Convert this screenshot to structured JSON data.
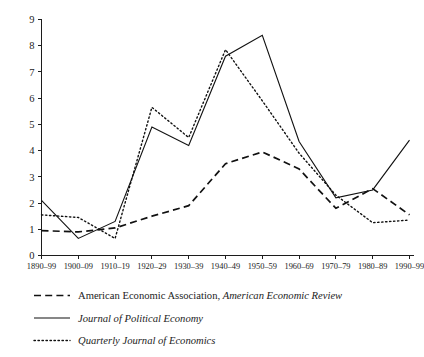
{
  "chart_data": {
    "type": "line",
    "title": "",
    "subtitle": "",
    "xlabel": "",
    "ylabel": "",
    "categories": [
      "1890–99",
      "1900–09",
      "1910–19",
      "1920–29",
      "1930–39",
      "1940–49",
      "1950–59",
      "1960–69",
      "1970–79",
      "1980–89",
      "1990–99"
    ],
    "ylim": [
      0,
      9
    ],
    "yticks": [
      0,
      1,
      2,
      3,
      4,
      5,
      6,
      7,
      8,
      9
    ],
    "ytick_labels": [
      "0",
      "1",
      "2",
      "3",
      "4",
      "5",
      "6",
      "7",
      "8",
      "9"
    ],
    "grid": false,
    "legend_position": "below",
    "series": [
      {
        "name": "American Economic Association, American Economic Review",
        "style": "dashed",
        "color": "#111111",
        "values": [
          0.95,
          0.9,
          1.05,
          1.5,
          1.9,
          3.5,
          3.95,
          3.3,
          1.8,
          2.55,
          1.55
        ]
      },
      {
        "name": "Journal of Political Economy",
        "style": "solid",
        "color": "#111111",
        "values": [
          2.1,
          0.65,
          1.3,
          4.9,
          4.2,
          7.6,
          8.4,
          4.35,
          2.2,
          2.5,
          4.4
        ]
      },
      {
        "name": "Quarterly Journal of Economics",
        "style": "dotted",
        "color": "#111111",
        "values": [
          1.55,
          1.45,
          0.65,
          5.65,
          4.5,
          7.85,
          5.9,
          3.9,
          2.3,
          1.25,
          1.35
        ]
      }
    ]
  },
  "legend": {
    "entries": [
      {
        "style": "dashed",
        "plain_text": "American Economic Association, ",
        "italic_text": "American Economic Review"
      },
      {
        "style": "solid",
        "plain_text": "",
        "italic_text": "Journal of Political Economy"
      },
      {
        "style": "dotted",
        "plain_text": "",
        "italic_text": "Quarterly Journal of Economics"
      }
    ]
  },
  "colors": {
    "ink": "#111111",
    "axis": "#1c1c1c",
    "background": "#ffffff"
  }
}
